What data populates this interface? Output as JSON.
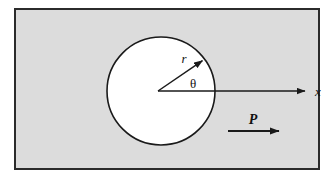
{
  "figure": {
    "type": "technical-diagram",
    "background_color": "#ffffff"
  },
  "plate": {
    "name": "plate-region",
    "fill_color": "#dcdcdc",
    "border_color": "#2b2b2b",
    "border_width": 2,
    "x": 14,
    "y": 8,
    "width": 306,
    "height": 162
  },
  "hole": {
    "name": "circular-hole",
    "fill_color": "#ffffff",
    "stroke_color": "#1a1a1a",
    "stroke_width": 1.6,
    "center_x": 161,
    "center_y": 91,
    "radius": 54
  },
  "origin": {
    "x": 158,
    "y": 91
  },
  "axes": {
    "x_axis": {
      "name": "x-axis-arrow",
      "label": "x",
      "color": "#1a1a1a",
      "from_x": 158,
      "from_y": 91,
      "to_x": 313,
      "to_y": 91,
      "label_x": 319,
      "label_y": 96
    }
  },
  "radius_vector": {
    "name": "radius-arrow",
    "label": "r",
    "color": "#1a1a1a",
    "from_x": 158,
    "from_y": 91,
    "to_x": 208,
    "to_y": 57,
    "label_x": 184,
    "label_y": 63
  },
  "angle": {
    "name": "theta-angle-label",
    "label": "θ",
    "label_x": 191,
    "label_y": 87,
    "arc_radius": 30,
    "start_deg": 0,
    "end_deg": 34
  },
  "load": {
    "name": "load-arrow",
    "label": "P",
    "color": "#1a1a1a",
    "from_x": 228,
    "from_y": 131,
    "to_x": 288,
    "to_y": 131,
    "label_x": 251,
    "label_y": 123
  },
  "colors": {
    "plate_fill": "#dcdcdc",
    "hole_fill": "#ffffff",
    "line": "#1a1a1a",
    "border": "#2b2b2b",
    "page": "#ffffff"
  }
}
